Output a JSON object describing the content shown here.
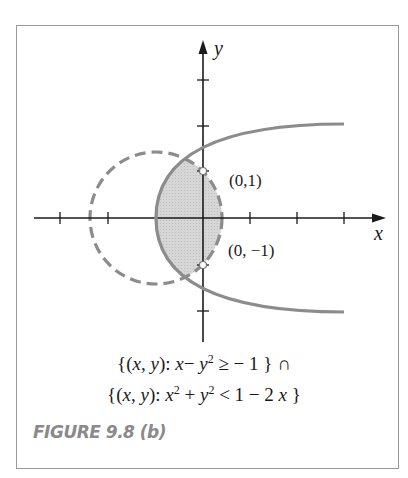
{
  "figure": {
    "label": "FIGURE 9.8 (b)",
    "axes": {
      "x_label": "x",
      "y_label": "y"
    },
    "points": [
      {
        "label": "(0,1)",
        "x": 0,
        "y": 1,
        "style": "open"
      },
      {
        "label": "(0, −1)",
        "x": 0,
        "y": -1,
        "style": "open"
      }
    ],
    "curves": [
      {
        "name": "parabola",
        "equation": "x = y^2 - 1",
        "style": "solid"
      },
      {
        "name": "circle",
        "equation": "(x+1)^2 + y^2 = 2",
        "style": "dashed"
      }
    ],
    "shaded_region": "intersection of x - y^2 >= -1 and x^2 + y^2 < 1 - 2x",
    "caption": {
      "line1": {
        "set_open": "{(",
        "x": "x",
        "comma": ", ",
        "y": "y",
        "close_colon": "):  ",
        "expr_x": "x",
        "minus": "− ",
        "expr_y": "y",
        "exp": "2",
        "rest": " ≥ − 1 } ∩"
      },
      "line2": {
        "set_open": "{(",
        "x": "x",
        "comma": ", ",
        "y": "y",
        "close_colon": "):  ",
        "expr_x": "x",
        "exp1": "2",
        "plus": " + ",
        "expr_y": "y",
        "exp2": "2",
        "rest": " < 1 − 2 ",
        "expr_x2": "x",
        "end": " }"
      }
    },
    "colors": {
      "curve": "#8c8c8c",
      "shade": "#d4d4d4",
      "axis": "#1a1a1a",
      "frame": "#9a9a9a",
      "label": "#8a8a8a"
    },
    "ticks": {
      "x": [
        -3,
        -2,
        -1,
        1,
        2,
        3
      ],
      "y": [
        -2,
        2,
        3
      ]
    }
  }
}
